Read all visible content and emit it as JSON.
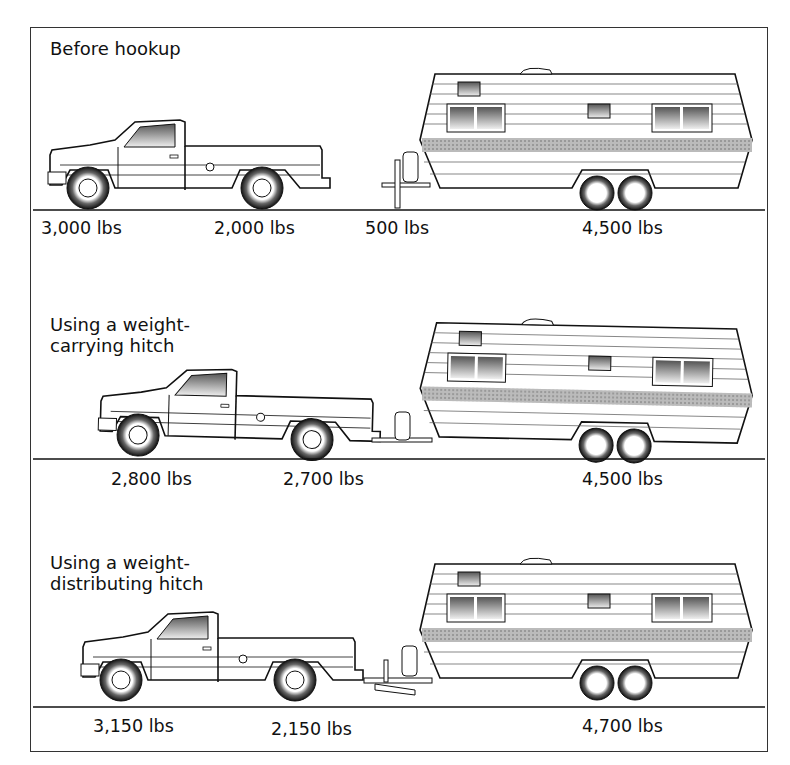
{
  "diagram": {
    "panels": [
      {
        "title_lines": [
          "Before hookup"
        ],
        "weights": [
          "3,000 lbs",
          "2,000 lbs",
          "500 lbs",
          "4,500 lbs"
        ],
        "components": [
          "truck",
          "trailer",
          "tongue-jack",
          "ground-line"
        ]
      },
      {
        "title_lines": [
          "Using a weight-",
          "carrying hitch"
        ],
        "weights": [
          "2,800 lbs",
          "2,700 lbs",
          "4,500 lbs"
        ],
        "components": [
          "truck",
          "trailer",
          "ball-hitch",
          "ground-line"
        ]
      },
      {
        "title_lines": [
          "Using a weight-",
          "distributing hitch"
        ],
        "weights": [
          "3,150 lbs",
          "2,150 lbs",
          "4,700 lbs"
        ],
        "components": [
          "truck",
          "trailer",
          "weight-distributing-hitch",
          "ground-line"
        ]
      }
    ]
  }
}
